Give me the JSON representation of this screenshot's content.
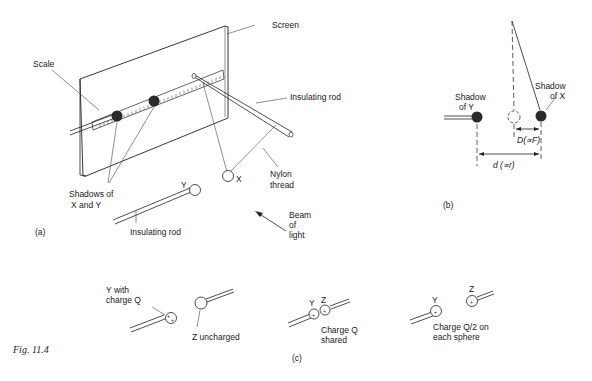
{
  "figure": {
    "caption": "Fig. 11.4",
    "panels": {
      "a": {
        "tag": "(a)",
        "labels": {
          "screen": "Screen",
          "scale": "Scale",
          "insulating_rod_top": "Insulating rod",
          "nylon_thread_1": "Nylon",
          "nylon_thread_2": "thread",
          "shadows_1": "Shadows of",
          "shadows_2": "X and Y",
          "sphere_x": "X",
          "sphere_y": "Y",
          "insulating_rod_bottom": "Insulating rod",
          "beam_1": "Beam",
          "beam_2": "of",
          "beam_3": "light"
        }
      },
      "b": {
        "tag": "(b)",
        "labels": {
          "shadow_y_1": "Shadow",
          "shadow_y_2": "of Y",
          "shadow_x_1": "Shadow",
          "shadow_x_2": "of X",
          "D_label": "D(∝F)",
          "d_label": "d (∝r)"
        }
      },
      "c": {
        "tag": "(c)",
        "labels": {
          "y_with_1": "Y with",
          "y_with_2": "charge Q",
          "z_uncharged": "Z uncharged",
          "y2": "Y",
          "z2": "Z",
          "shared_1": "Charge Q",
          "shared_2": "shared",
          "y3": "Y",
          "z3": "Z",
          "half_1": "Charge  Q/2 on",
          "half_2": "each sphere",
          "plus": "+"
        }
      }
    }
  }
}
